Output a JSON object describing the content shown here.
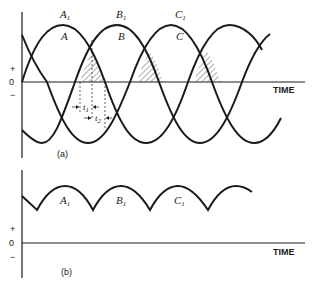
{
  "panel_a": {
    "caption": "(a)",
    "axis": {
      "plus": "+",
      "zero": "0",
      "minus": "−",
      "xlabel": "TIME"
    },
    "curve_labels": [
      {
        "name": "A",
        "sub": "1"
      },
      {
        "name": "B",
        "sub": "1"
      },
      {
        "name": "C",
        "sub": "1"
      }
    ],
    "inner_labels": [
      "A",
      "B",
      "C"
    ],
    "intervals": [
      {
        "name": "t",
        "sub": "1"
      },
      {
        "name": "t",
        "sub": "2"
      }
    ]
  },
  "panel_b": {
    "caption": "(b)",
    "axis": {
      "plus": "+",
      "zero": "0",
      "minus": "−",
      "xlabel": "TIME"
    },
    "hump_labels": [
      {
        "name": "A",
        "sub": "1"
      },
      {
        "name": "B",
        "sub": "1"
      },
      {
        "name": "C",
        "sub": "1"
      }
    ]
  },
  "colors": {
    "line": "#1a1a1a",
    "background": "#ffffff"
  }
}
